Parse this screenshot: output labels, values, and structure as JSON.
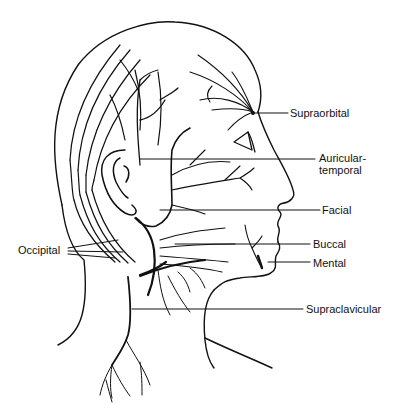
{
  "figure": {
    "labels": {
      "supraorbital": "Supraorbital",
      "auriculotemporal_line1": "Auricular-",
      "auriculotemporal_line2": "temporal",
      "facial": "Facial",
      "buccal": "Buccal",
      "mental": "Mental",
      "supraclavicular": "Supraclavicular",
      "occipital": "Occipital"
    },
    "colors": {
      "line": "#111111",
      "background": "#ffffff"
    }
  }
}
